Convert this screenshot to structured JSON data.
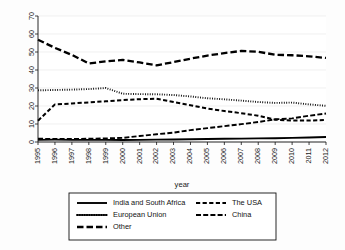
{
  "chart_data": {
    "type": "line",
    "title": "",
    "xlabel": "year",
    "ylabel": "",
    "xlim": [
      1995,
      2012
    ],
    "ylim": [
      0,
      70
    ],
    "grid": true,
    "legend_position": "bottom",
    "x": [
      1995,
      1996,
      1997,
      1998,
      1999,
      2000,
      2001,
      2002,
      2003,
      2004,
      2005,
      2006,
      2007,
      2008,
      2009,
      2010,
      2011,
      2012
    ],
    "xtick_labels": [
      "1995",
      "1996",
      "1997",
      "1998",
      "1999",
      "2000",
      "2001",
      "2002",
      "2003",
      "2004",
      "2005",
      "2006",
      "2007",
      "2008",
      "2009",
      "2010",
      "2011",
      "2012"
    ],
    "ytick_labels": [
      "0",
      "10",
      "20",
      "30",
      "40",
      "50",
      "60",
      "70"
    ],
    "ytick_values": [
      0,
      10,
      20,
      30,
      40,
      50,
      60,
      70
    ],
    "series": [
      {
        "name": "India and South Africa",
        "style": "solid",
        "values": [
          1.2,
          1.3,
          1.2,
          1.2,
          1.2,
          1.1,
          1.2,
          1.3,
          1.4,
          1.5,
          1.7,
          1.8,
          1.9,
          2.0,
          2.1,
          2.3,
          2.5,
          2.8
        ]
      },
      {
        "name": "The USA",
        "style": "dashed",
        "values": [
          11.8,
          20.9,
          21.4,
          22.0,
          22.6,
          23.3,
          23.8,
          24.0,
          22.2,
          20.4,
          18.6,
          17.2,
          16.0,
          14.6,
          12.4,
          11.9,
          11.9,
          12.2
        ]
      },
      {
        "name": "European Union",
        "style": "dotted",
        "values": [
          28.7,
          28.9,
          29.1,
          29.4,
          30.0,
          26.8,
          26.6,
          26.5,
          26.1,
          25.3,
          24.3,
          23.7,
          23.0,
          22.2,
          21.7,
          21.9,
          20.9,
          20.1
        ]
      },
      {
        "name": "China",
        "style": "dash-dot",
        "values": [
          1.8,
          1.7,
          1.7,
          1.8,
          2.0,
          2.3,
          3.3,
          4.3,
          5.2,
          6.6,
          7.7,
          8.8,
          9.9,
          11.1,
          12.6,
          13.1,
          14.6,
          15.8
        ]
      },
      {
        "name": "Other",
        "style": "longdash",
        "values": [
          56.8,
          52.3,
          48.4,
          43.6,
          44.8,
          45.6,
          44.2,
          42.6,
          44.4,
          46.3,
          48.0,
          49.4,
          50.6,
          50.1,
          48.5,
          48.2,
          47.6,
          46.7
        ]
      }
    ]
  },
  "legend": {
    "entries": [
      {
        "label": "India and South Africa",
        "style": "solid"
      },
      {
        "label": "The USA",
        "style": "dashed"
      },
      {
        "label": "European Union",
        "style": "dotted"
      },
      {
        "label": "China",
        "style": "dash-dot"
      },
      {
        "label": "Other",
        "style": "longdash"
      }
    ]
  },
  "axes": {
    "x_axis_label": "year"
  },
  "colors": {
    "line": "#000000",
    "grid": "#e9e9e9",
    "axis": "#111111",
    "background": "#fdfdfd"
  }
}
